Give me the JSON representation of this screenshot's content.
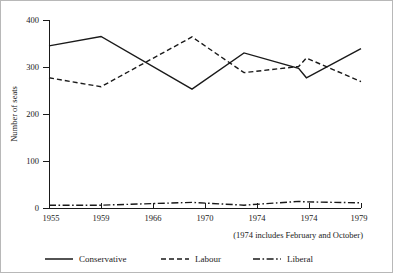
{
  "chart_data": {
    "type": "line",
    "title": "",
    "xlabel": "",
    "ylabel": "Number of seats",
    "ylim": [
      0,
      400
    ],
    "yticks": [
      0,
      100,
      200,
      300,
      400
    ],
    "ytick_labels": [
      "0",
      "100",
      "200",
      "300",
      "400"
    ],
    "categories": [
      "1955",
      "1959",
      "1966",
      "1970",
      "1974",
      "1974",
      "1979"
    ],
    "x": [
      1955,
      1959,
      1966,
      1970,
      1974.2,
      1974.8,
      1979
    ],
    "grid": false,
    "legend_position": "bottom",
    "annotation": "(1974 includes February and October)",
    "series": [
      {
        "name": "Conservative",
        "linestyle": "solid",
        "color": "#1a1a1a",
        "values": [
          345,
          365,
          253,
          330,
          297,
          277,
          339
        ]
      },
      {
        "name": "Labour",
        "linestyle": "dashed",
        "color": "#1a1a1a",
        "values": [
          277,
          258,
          364,
          288,
          301,
          319,
          269
        ]
      },
      {
        "name": "Liberal",
        "linestyle": "dashdot",
        "color": "#1a1a1a",
        "values": [
          6,
          6,
          12,
          6,
          14,
          13,
          11
        ]
      }
    ]
  },
  "axes": {
    "ylabel": "Number of seats",
    "ytick_labels": [
      "0",
      "100",
      "200",
      "300",
      "400"
    ],
    "xtick_labels": [
      "1955",
      "1959",
      "1966",
      "1970",
      "1974",
      "1974",
      "1979"
    ]
  },
  "annotation": {
    "text": "(1974 includes February and October)"
  },
  "legend": {
    "items": [
      {
        "label": "Conservative"
      },
      {
        "label": "Labour"
      },
      {
        "label": "Liberal"
      }
    ]
  }
}
